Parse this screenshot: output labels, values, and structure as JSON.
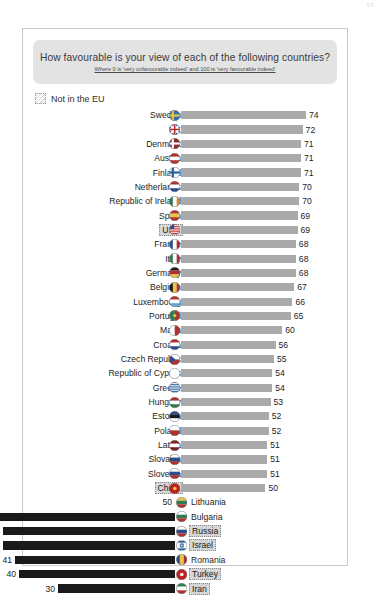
{
  "page_number": "55",
  "header": {
    "title": "How favourable is your view of each of the following countries?",
    "subtitle": "Where 0 is 'very unfavourable indeed' and 100 is 'very favourable indeed'"
  },
  "legend": {
    "label": "Not in the EU",
    "swatch_name": "hatched-swatch"
  },
  "colors": {
    "bar_high": "#aaaaaa",
    "bar_low": "#1a1a1a",
    "band_background": "#e3e3e3",
    "card_border": "#c9c9c9",
    "text": "#1c1c1c",
    "highlight_fill": "#d9d9d9"
  },
  "chart_data": {
    "type": "bar",
    "title": "How favourable is your view of each of the following countries?",
    "subtitle": "Where 0 is 'very unfavourable indeed' and 100 is 'very favourable indeed'",
    "xlabel": "",
    "ylabel": "",
    "orientation": "horizontal",
    "baseline": 50,
    "xlim": [
      30,
      74
    ],
    "grid": false,
    "legend": [
      "Not in the EU"
    ],
    "categories": [
      "Sweden",
      "UK",
      "Denmark",
      "Austria",
      "Finland",
      "Netherlands",
      "Republic of Ireland",
      "Spain",
      "USA",
      "France",
      "Italy",
      "Germany",
      "Belgium",
      "Luxembourg",
      "Portugal",
      "Malta",
      "Croatia",
      "Czech Republic",
      "Republic of Cyprus",
      "Greece",
      "Hungary",
      "Estonia",
      "Poland",
      "Latvia",
      "Slovakia",
      "Slovenia",
      "China",
      "Lithuania",
      "Bulgaria",
      "Russia",
      "Israel",
      "Romania",
      "Turkey",
      "Iran"
    ],
    "values": [
      74,
      72,
      71,
      71,
      71,
      70,
      70,
      69,
      69,
      68,
      68,
      68,
      67,
      66,
      65,
      60,
      56,
      55,
      54,
      54,
      53,
      52,
      52,
      51,
      51,
      51,
      50,
      50,
      47,
      44,
      44,
      41,
      40,
      30
    ],
    "rows": [
      {
        "country": "Sweden",
        "value": 74,
        "direction": "right",
        "not_in_eu": false,
        "flag": "flag-sweden"
      },
      {
        "country": "UK",
        "value": 72,
        "direction": "right",
        "not_in_eu": false,
        "flag": "flag-uk"
      },
      {
        "country": "Denmark",
        "value": 71,
        "direction": "right",
        "not_in_eu": false,
        "flag": "flag-denmark"
      },
      {
        "country": "Austria",
        "value": 71,
        "direction": "right",
        "not_in_eu": false,
        "flag": "flag-austria"
      },
      {
        "country": "Finland",
        "value": 71,
        "direction": "right",
        "not_in_eu": false,
        "flag": "flag-finland"
      },
      {
        "country": "Netherlands",
        "value": 70,
        "direction": "right",
        "not_in_eu": false,
        "flag": "flag-netherlands"
      },
      {
        "country": "Republic of Ireland",
        "value": 70,
        "direction": "right",
        "not_in_eu": false,
        "flag": "flag-ireland"
      },
      {
        "country": "Spain",
        "value": 69,
        "direction": "right",
        "not_in_eu": false,
        "flag": "flag-spain"
      },
      {
        "country": "USA",
        "value": 69,
        "direction": "right",
        "not_in_eu": true,
        "flag": "flag-usa"
      },
      {
        "country": "France",
        "value": 68,
        "direction": "right",
        "not_in_eu": false,
        "flag": "flag-france"
      },
      {
        "country": "Italy",
        "value": 68,
        "direction": "right",
        "not_in_eu": false,
        "flag": "flag-italy"
      },
      {
        "country": "Germany",
        "value": 68,
        "direction": "right",
        "not_in_eu": false,
        "flag": "flag-germany"
      },
      {
        "country": "Belgium",
        "value": 67,
        "direction": "right",
        "not_in_eu": false,
        "flag": "flag-belgium"
      },
      {
        "country": "Luxembourg",
        "value": 66,
        "direction": "right",
        "not_in_eu": false,
        "flag": "flag-luxembourg"
      },
      {
        "country": "Portugal",
        "value": 65,
        "direction": "right",
        "not_in_eu": false,
        "flag": "flag-portugal"
      },
      {
        "country": "Malta",
        "value": 60,
        "direction": "right",
        "not_in_eu": false,
        "flag": "flag-malta"
      },
      {
        "country": "Croatia",
        "value": 56,
        "direction": "right",
        "not_in_eu": false,
        "flag": "flag-croatia"
      },
      {
        "country": "Czech Republic",
        "value": 55,
        "direction": "right",
        "not_in_eu": false,
        "flag": "flag-czech-republic"
      },
      {
        "country": "Republic of Cyprus",
        "value": 54,
        "direction": "right",
        "not_in_eu": false,
        "flag": "flag-cyprus"
      },
      {
        "country": "Greece",
        "value": 54,
        "direction": "right",
        "not_in_eu": false,
        "flag": "flag-greece"
      },
      {
        "country": "Hungary",
        "value": 53,
        "direction": "right",
        "not_in_eu": false,
        "flag": "flag-hungary"
      },
      {
        "country": "Estonia",
        "value": 52,
        "direction": "right",
        "not_in_eu": false,
        "flag": "flag-estonia"
      },
      {
        "country": "Poland",
        "value": 52,
        "direction": "right",
        "not_in_eu": false,
        "flag": "flag-poland"
      },
      {
        "country": "Latvia",
        "value": 51,
        "direction": "right",
        "not_in_eu": false,
        "flag": "flag-latvia"
      },
      {
        "country": "Slovakia",
        "value": 51,
        "direction": "right",
        "not_in_eu": false,
        "flag": "flag-slovakia"
      },
      {
        "country": "Slovenia",
        "value": 51,
        "direction": "right",
        "not_in_eu": false,
        "flag": "flag-slovenia"
      },
      {
        "country": "China",
        "value": 50,
        "direction": "right",
        "not_in_eu": true,
        "flag": "flag-china"
      },
      {
        "country": "Lithuania",
        "value": 50,
        "direction": "left",
        "not_in_eu": false,
        "flag": "flag-lithuania"
      },
      {
        "country": "Bulgaria",
        "value": 47,
        "direction": "left",
        "not_in_eu": false,
        "flag": "flag-bulgaria"
      },
      {
        "country": "Russia",
        "value": 44,
        "direction": "left",
        "not_in_eu": true,
        "flag": "flag-russia"
      },
      {
        "country": "Israel",
        "value": 44,
        "direction": "left",
        "not_in_eu": true,
        "flag": "flag-israel"
      },
      {
        "country": "Romania",
        "value": 41,
        "direction": "left",
        "not_in_eu": false,
        "flag": "flag-romania"
      },
      {
        "country": "Turkey",
        "value": 40,
        "direction": "left",
        "not_in_eu": true,
        "flag": "flag-turkey"
      },
      {
        "country": "Iran",
        "value": 30,
        "direction": "left",
        "not_in_eu": true,
        "flag": "flag-iran"
      }
    ]
  }
}
